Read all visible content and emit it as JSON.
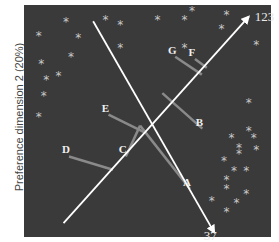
{
  "chart_data": {
    "type": "scatter",
    "title": "",
    "ylabel": "Preference dimension 2 (20%)",
    "xlabel": "",
    "background": "#3a3a3a",
    "consumer_points": [
      [
        0.06,
        0.87
      ],
      [
        0.17,
        0.93
      ],
      [
        0.22,
        0.86
      ],
      [
        0.19,
        0.78
      ],
      [
        0.07,
        0.75
      ],
      [
        0.09,
        0.68
      ],
      [
        0.14,
        0.7
      ],
      [
        0.08,
        0.61
      ],
      [
        0.06,
        0.52
      ],
      [
        0.33,
        0.94
      ],
      [
        0.39,
        0.92
      ],
      [
        0.39,
        0.82
      ],
      [
        0.54,
        0.94
      ],
      [
        0.65,
        0.94
      ],
      [
        0.68,
        0.98
      ],
      [
        0.65,
        0.82
      ],
      [
        0.82,
        0.96
      ],
      [
        0.94,
        0.83
      ],
      [
        0.8,
        0.9
      ],
      [
        0.91,
        0.58
      ],
      [
        0.91,
        0.46
      ],
      [
        0.84,
        0.43
      ],
      [
        0.93,
        0.43
      ],
      [
        0.87,
        0.39
      ],
      [
        0.87,
        0.36
      ],
      [
        0.94,
        0.38
      ],
      [
        0.81,
        0.33
      ],
      [
        0.85,
        0.29
      ],
      [
        0.9,
        0.29
      ],
      [
        0.82,
        0.25
      ],
      [
        0.82,
        0.21
      ],
      [
        0.9,
        0.19
      ],
      [
        0.76,
        0.16
      ],
      [
        0.86,
        0.15
      ],
      [
        0.82,
        0.11
      ]
    ],
    "vectors": [
      {
        "label": "123",
        "from": [
          0.16,
          0.06
        ],
        "to": [
          0.91,
          0.95
        ]
      },
      {
        "label": "37",
        "from": [
          0.28,
          0.93
        ],
        "to": [
          0.77,
          0.02
        ]
      }
    ],
    "products": [
      {
        "label": "A",
        "x": 0.66,
        "y": 0.22,
        "proj": [
          0.47,
          0.48
        ]
      },
      {
        "label": "B",
        "x": 0.71,
        "y": 0.48,
        "proj": [
          0.56,
          0.62
        ]
      },
      {
        "label": "C",
        "x": 0.4,
        "y": 0.36,
        "proj": [
          0.47,
          0.48
        ]
      },
      {
        "label": "D",
        "x": 0.17,
        "y": 0.36,
        "proj": [
          0.36,
          0.29
        ]
      },
      {
        "label": "E",
        "x": 0.33,
        "y": 0.54,
        "proj": [
          0.49,
          0.45
        ]
      },
      {
        "label": "F",
        "x": 0.68,
        "y": 0.78,
        "proj": [
          0.74,
          0.73
        ]
      },
      {
        "label": "G",
        "x": 0.6,
        "y": 0.79,
        "proj": [
          0.72,
          0.7
        ]
      }
    ]
  }
}
